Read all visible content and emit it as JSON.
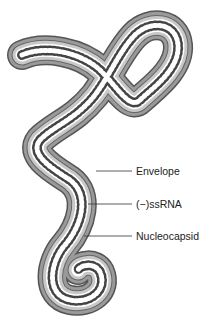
{
  "diagram": {
    "labels": [
      {
        "id": "envelope",
        "text": "Envelope"
      },
      {
        "id": "ssrna",
        "text": "(−)ssRNA"
      },
      {
        "id": "nucleocapsid",
        "text": "Nucleocapsid"
      }
    ],
    "colors": {
      "envelope_fill": "#9a9a9a",
      "envelope_edge": "#555555",
      "inner_band": "#c8c8c8",
      "core": "#ffffff",
      "coil": "#444444",
      "leader_line": "#333333"
    }
  }
}
